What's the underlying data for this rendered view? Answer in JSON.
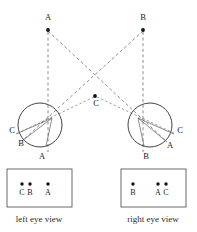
{
  "figure": {
    "background_color": "#ffffff",
    "line_color": "#6e6e6e",
    "stroke_color": "#2e2e2e",
    "dot_color": "#111111"
  },
  "scene": {
    "objects": [
      {
        "id": "A",
        "label": "A",
        "label_x": 48,
        "label_y": 20,
        "dot_x": 48,
        "dot_y": 30
      },
      {
        "id": "B",
        "label": "B",
        "label_x": 143,
        "label_y": 20,
        "dot_x": 143,
        "dot_y": 30
      },
      {
        "id": "C",
        "label": "C",
        "label_x": 96,
        "label_y": 106,
        "dot_x": 95,
        "dot_y": 96
      }
    ]
  },
  "left_eye": {
    "name": "left-eye",
    "center_x": 40,
    "center_y": 125,
    "radius": 22,
    "labels": [
      {
        "id": "C",
        "label": "C",
        "x": 12,
        "y": 133
      },
      {
        "id": "B",
        "label": "B",
        "x": 21,
        "y": 146
      },
      {
        "id": "A",
        "label": "A",
        "x": 42,
        "y": 159
      }
    ]
  },
  "right_eye": {
    "name": "right-eye",
    "center_x": 150,
    "center_y": 125,
    "radius": 22,
    "labels": [
      {
        "id": "C",
        "label": "C",
        "x": 180,
        "y": 133
      },
      {
        "id": "A",
        "label": "A",
        "x": 170,
        "y": 148
      },
      {
        "id": "B",
        "label": "B",
        "x": 146,
        "y": 159
      }
    ]
  },
  "left_view_panel": {
    "name": "left-eye-view-panel",
    "box": {
      "x": 7,
      "y": 169,
      "width": 65,
      "height": 38
    },
    "caption": "left eye view",
    "caption_x": 39,
    "caption_y": 222,
    "points": [
      {
        "id": "C",
        "label": "C",
        "dot_x": 22,
        "dot_y": 184,
        "label_x": 22,
        "label_y": 195
      },
      {
        "id": "B",
        "label": "B",
        "dot_x": 30,
        "dot_y": 184,
        "label_x": 30,
        "label_y": 195
      },
      {
        "id": "A",
        "label": "A",
        "dot_x": 48,
        "dot_y": 184,
        "label_x": 48,
        "label_y": 195
      }
    ]
  },
  "right_view_panel": {
    "name": "right-eye-view-panel",
    "box": {
      "x": 121,
      "y": 169,
      "width": 65,
      "height": 38
    },
    "caption": "right eye view",
    "caption_x": 153,
    "caption_y": 222,
    "points": [
      {
        "id": "B",
        "label": "B",
        "dot_x": 133,
        "dot_y": 184,
        "label_x": 133,
        "label_y": 195
      },
      {
        "id": "A",
        "label": "A",
        "dot_x": 158,
        "dot_y": 184,
        "label_x": 158,
        "label_y": 195
      },
      {
        "id": "C",
        "label": "C",
        "dot_x": 166,
        "dot_y": 184,
        "label_x": 166,
        "label_y": 195
      }
    ]
  }
}
